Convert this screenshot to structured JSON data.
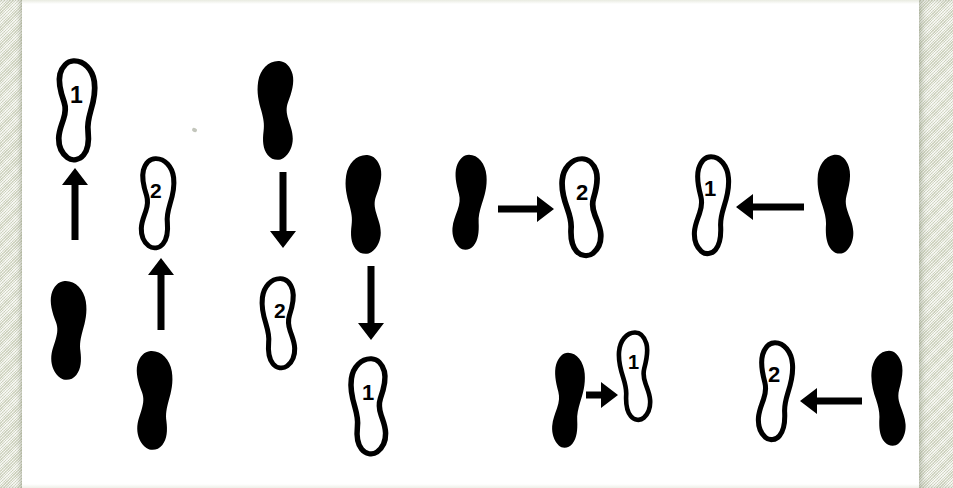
{
  "figure": {
    "canvas": {
      "width": 953,
      "height": 488
    },
    "colors": {
      "ink": "#000000",
      "paper": "#ffffff",
      "scanner_bed": "#e6e8da"
    },
    "paper": {
      "left": 22,
      "top": 0,
      "width": 897,
      "height": 488
    },
    "bands": [
      {
        "name": "left-scanner-band",
        "left": 0,
        "width": 22
      },
      {
        "name": "right-scanner-band",
        "left": 919,
        "width": 34
      }
    ]
  },
  "legend": {
    "filled_meaning": "filled-footprint",
    "outline_meaning": "outline-footprint",
    "arrow_meaning": "movement-direction"
  },
  "groups": [
    {
      "id": "group-1",
      "name": "upward-pair",
      "direction": "up",
      "pairs": [
        {
          "id": "g1-pair-a",
          "source": {
            "style": "filled",
            "label": "",
            "side": "left",
            "x": 42,
            "y": 278,
            "w": 52,
            "h": 104,
            "rotate": -4,
            "flip": false
          },
          "target": {
            "style": "outline",
            "label": "1",
            "side": "left",
            "x": 50,
            "y": 58,
            "w": 52,
            "h": 104,
            "rotate": -3,
            "flip": false,
            "label_dx": 20,
            "label_dy": 26
          },
          "arrow": {
            "direction": "up",
            "x": 62,
            "y": 168,
            "length": 72
          }
        },
        {
          "id": "g1-pair-b",
          "source": {
            "style": "filled",
            "label": "",
            "side": "left",
            "x": 128,
            "y": 348,
            "w": 52,
            "h": 104,
            "rotate": -4,
            "flip": false
          },
          "target": {
            "style": "outline",
            "label": "2",
            "side": "left",
            "x": 134,
            "y": 156,
            "w": 46,
            "h": 94,
            "rotate": -2,
            "flip": false,
            "label_dx": 16,
            "label_dy": 24
          },
          "arrow": {
            "direction": "up",
            "x": 148,
            "y": 258,
            "length": 72
          }
        }
      ]
    },
    {
      "id": "group-2",
      "name": "downward-pair",
      "direction": "down",
      "pairs": [
        {
          "id": "g2-pair-a",
          "source": {
            "style": "filled",
            "label": "",
            "side": "right",
            "x": 250,
            "y": 58,
            "w": 52,
            "h": 104,
            "rotate": 4,
            "flip": true
          },
          "target": {
            "style": "outline",
            "label": "2",
            "side": "right",
            "x": 256,
            "y": 276,
            "w": 46,
            "h": 94,
            "rotate": 2,
            "flip": true,
            "label_dx": 16,
            "label_dy": 24
          },
          "arrow": {
            "direction": "down",
            "x": 270,
            "y": 172,
            "length": 76
          }
        },
        {
          "id": "g2-pair-b",
          "source": {
            "style": "filled",
            "label": "",
            "side": "right",
            "x": 338,
            "y": 152,
            "w": 52,
            "h": 104,
            "rotate": 4,
            "flip": true
          },
          "target": {
            "style": "outline",
            "label": "1",
            "side": "right",
            "x": 344,
            "y": 356,
            "w": 50,
            "h": 100,
            "rotate": 3,
            "flip": true,
            "label_dx": 20,
            "label_dy": 26
          },
          "arrow": {
            "direction": "down",
            "x": 358,
            "y": 266,
            "length": 74
          }
        }
      ]
    },
    {
      "id": "group-3",
      "name": "rightward-pair",
      "direction": "right",
      "pairs": [
        {
          "id": "g3-pair-a",
          "source": {
            "style": "filled",
            "label": "",
            "side": "left",
            "x": 446,
            "y": 152,
            "w": 46,
            "h": 100,
            "rotate": 0,
            "flip": false
          },
          "target": {
            "style": "outline",
            "label": "2",
            "side": "right",
            "x": 556,
            "y": 156,
            "w": 52,
            "h": 102,
            "rotate": 0,
            "flip": true,
            "label_dx": 20,
            "label_dy": 26
          },
          "arrow": {
            "direction": "right",
            "x": 498,
            "y": 196,
            "length": 56
          }
        },
        {
          "id": "g3-pair-b",
          "source": {
            "style": "filled",
            "label": "",
            "side": "left",
            "x": 546,
            "y": 350,
            "w": 44,
            "h": 100,
            "rotate": 0,
            "flip": false
          },
          "target": {
            "style": "outline",
            "label": "1",
            "side": "right",
            "x": 614,
            "y": 330,
            "w": 42,
            "h": 92,
            "rotate": 0,
            "flip": true,
            "label_dx": 16,
            "label_dy": 22
          },
          "arrow": {
            "direction": "right",
            "x": 586,
            "y": 382,
            "length": 32
          }
        }
      ]
    },
    {
      "id": "group-4",
      "name": "leftward-pair",
      "direction": "left",
      "pairs": [
        {
          "id": "g4-pair-a",
          "source": {
            "style": "filled",
            "label": "",
            "side": "right",
            "x": 812,
            "y": 152,
            "w": 48,
            "h": 104,
            "rotate": 0,
            "flip": true
          },
          "target": {
            "style": "outline",
            "label": "1",
            "side": "left",
            "x": 688,
            "y": 154,
            "w": 46,
            "h": 102,
            "rotate": 0,
            "flip": false,
            "label_dx": 16,
            "label_dy": 24
          },
          "arrow": {
            "direction": "left",
            "x": 736,
            "y": 194,
            "length": 68
          }
        },
        {
          "id": "g4-pair-b",
          "source": {
            "style": "filled",
            "label": "",
            "side": "right",
            "x": 866,
            "y": 348,
            "w": 46,
            "h": 100,
            "rotate": 0,
            "flip": true
          },
          "target": {
            "style": "outline",
            "label": "2",
            "side": "left",
            "x": 752,
            "y": 340,
            "w": 46,
            "h": 102,
            "rotate": 0,
            "flip": false,
            "label_dx": 16,
            "label_dy": 24
          },
          "arrow": {
            "direction": "left",
            "x": 800,
            "y": 388,
            "length": 62
          }
        }
      ]
    }
  ],
  "artifacts": [
    {
      "name": "scan-speck",
      "x": 192,
      "y": 128
    }
  ]
}
